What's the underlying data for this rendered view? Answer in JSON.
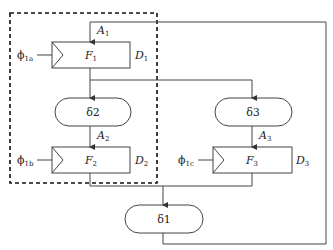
{
  "diagram": {
    "type": "block-diagram",
    "region_dashed_box": "F1-F2-loop",
    "blocks": [
      {
        "id": "F1",
        "label": "F",
        "sub": "1",
        "right_label": "D",
        "right_sub": "1",
        "clock": "ϕ",
        "clock_sub": "1a",
        "input_label": "A",
        "input_sub": "1"
      },
      {
        "id": "F2",
        "label": "F",
        "sub": "2",
        "right_label": "D",
        "right_sub": "2",
        "clock": "ϕ",
        "clock_sub": "1b",
        "input_label": "A",
        "input_sub": "2"
      },
      {
        "id": "F3",
        "label": "F",
        "sub": "3",
        "right_label": "D",
        "right_sub": "3",
        "clock": "ϕ",
        "clock_sub": "1c",
        "input_label": "A",
        "input_sub": "3"
      }
    ],
    "delays": [
      {
        "id": "d2",
        "label": "δ2"
      },
      {
        "id": "d3",
        "label": "δ3"
      },
      {
        "id": "d1",
        "label": "δ1"
      }
    ]
  }
}
